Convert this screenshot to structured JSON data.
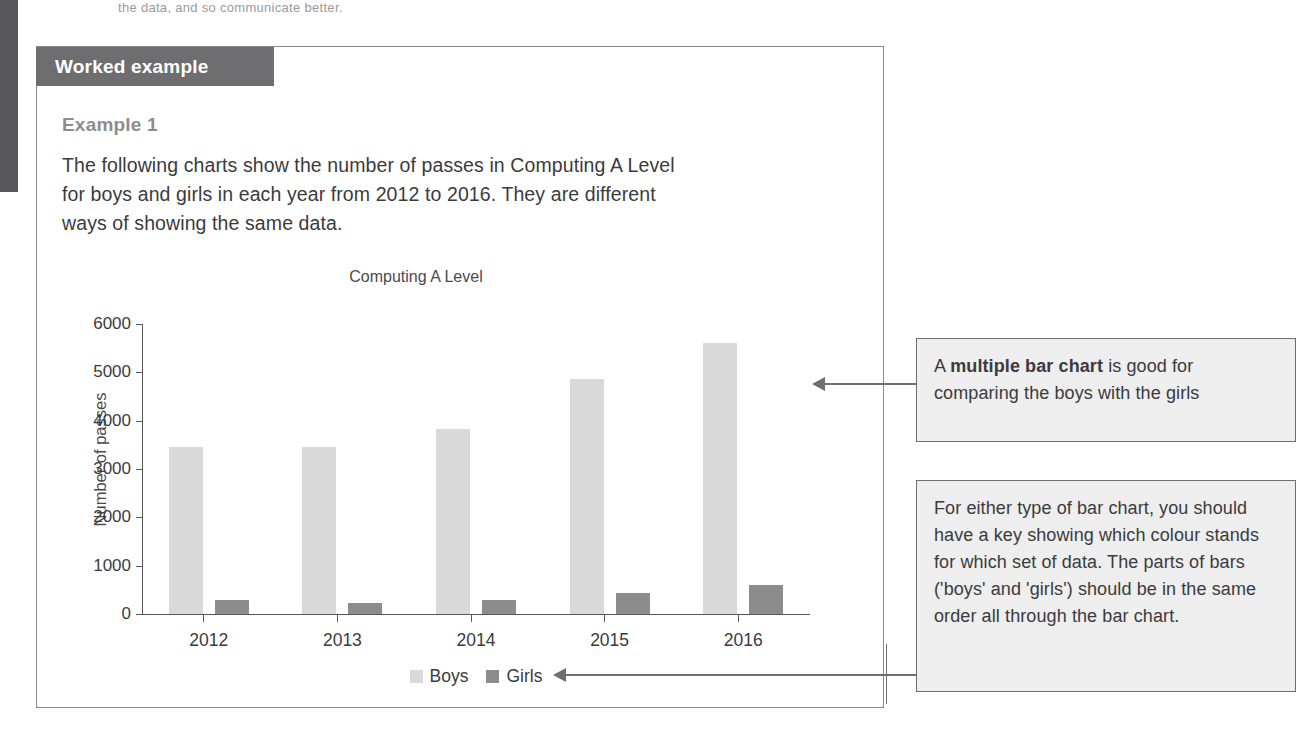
{
  "page": {
    "top_fragment": "the data, and so communicate better.",
    "panel_header": "Worked example",
    "example_title": "Example 1",
    "intro_text": "The following charts show the number of passes in Computing A Level for boys and girls in each year from 2012 to 2016. They are different ways of showing the same data."
  },
  "chart_data": {
    "type": "bar",
    "title": "Computing A Level",
    "xlabel": "",
    "ylabel": "Number of passes",
    "categories": [
      "2012",
      "2013",
      "2014",
      "2015",
      "2016"
    ],
    "series": [
      {
        "name": "Boys",
        "color": "#d9d9d9",
        "values": [
          3450,
          3450,
          3820,
          4870,
          5600
        ]
      },
      {
        "name": "Girls",
        "color": "#8c8c8c",
        "values": [
          280,
          220,
          290,
          440,
          600
        ]
      }
    ],
    "ylim": [
      0,
      6000
    ],
    "ytick_labels": [
      "6000",
      "5000",
      "4000",
      "3000",
      "2000",
      "1000",
      "0"
    ],
    "ytick_values": [
      6000,
      5000,
      4000,
      3000,
      2000,
      1000,
      0
    ],
    "grid": false,
    "legend_position": "bottom"
  },
  "callouts": [
    {
      "id": "multiple-bar-chart-note",
      "text_before": "A ",
      "text_bold": "multiple bar chart",
      "text_after": " is good for comparing the boys with the girls"
    },
    {
      "id": "key-order-note",
      "text": "For either type of bar chart, you should have a key showing which colour stands for which set of data. The parts of bars ('boys' and 'girls') should be in the same order all through the bar chart."
    }
  ]
}
